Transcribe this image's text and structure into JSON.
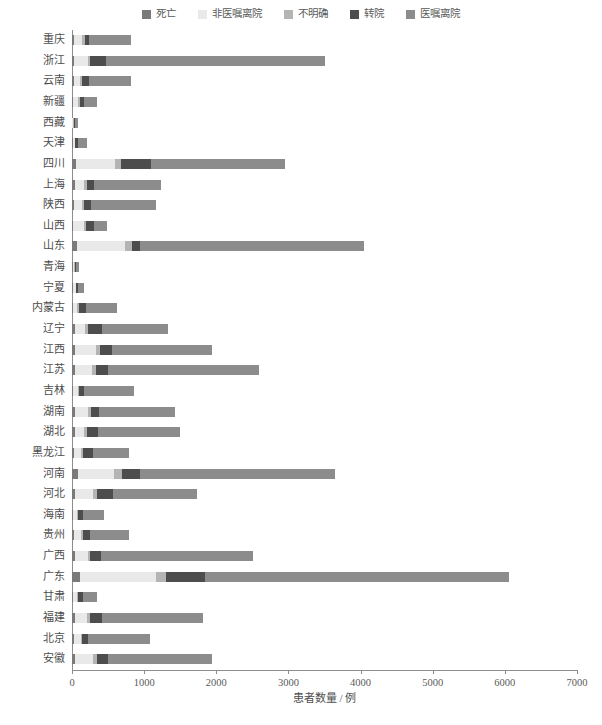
{
  "chart_data": {
    "type": "bar",
    "orientation": "horizontal",
    "stacked": true,
    "title": "",
    "subtitle": "",
    "xlabel": "患者数量 / 例",
    "ylabel": "",
    "xlim": [
      0,
      7000
    ],
    "xticks": [
      0,
      1000,
      2000,
      3000,
      4000,
      5000,
      6000,
      7000
    ],
    "xticklabels": [
      "0",
      "1000",
      "2000",
      "3000",
      "4000",
      "5000",
      "6000",
      "7000"
    ],
    "grid": false,
    "legend_position": "top-center",
    "legend": [
      "死亡",
      "非医嘱离院",
      "不明确",
      "转院",
      "医嘱离院"
    ],
    "colors": [
      "#7a7a7a",
      "#e9e9e9",
      "#b4b4b4",
      "#4d4d4d",
      "#8c8c8c"
    ],
    "categories": [
      "重庆",
      "浙江",
      "云南",
      "新疆",
      "西藏",
      "天津",
      "四川",
      "上海",
      "陕西",
      "山西",
      "山东",
      "青海",
      "宁夏",
      "内蒙古",
      "辽宁",
      "江西",
      "江苏",
      "吉林",
      "湖南",
      "湖北",
      "黑龙江",
      "河南",
      "河北",
      "海南",
      "贵州",
      "广西",
      "广东",
      "甘肃",
      "福建",
      "北京",
      "安徽"
    ],
    "series": [
      {
        "name": "死亡",
        "color": "#7a7a7a",
        "values": [
          25,
          30,
          25,
          20,
          5,
          10,
          60,
          40,
          30,
          20,
          70,
          10,
          10,
          20,
          35,
          35,
          45,
          20,
          35,
          35,
          25,
          90,
          45,
          15,
          25,
          40,
          110,
          15,
          35,
          25,
          40
        ]
      },
      {
        "name": "非医嘱离院",
        "color": "#e9e9e9",
        "values": [
          115,
          190,
          85,
          70,
          15,
          25,
          540,
          130,
          105,
          140,
          660,
          20,
          40,
          55,
          150,
          300,
          235,
          60,
          190,
          135,
          95,
          490,
          250,
          55,
          95,
          175,
          1060,
          55,
          175,
          95,
          250
        ]
      },
      {
        "name": "不明确",
        "color": "#b4b4b4",
        "values": [
          35,
          30,
          30,
          25,
          5,
          10,
          80,
          40,
          30,
          30,
          100,
          10,
          10,
          20,
          35,
          55,
          50,
          20,
          40,
          35,
          30,
          110,
          55,
          20,
          30,
          40,
          130,
          20,
          40,
          25,
          55
        ]
      },
      {
        "name": "转院",
        "color": "#4d4d4d",
        "values": [
          60,
          225,
          95,
          55,
          10,
          40,
          415,
          95,
          95,
          120,
          115,
          15,
          20,
          95,
          190,
          165,
          175,
          70,
          110,
          155,
          135,
          250,
          220,
          65,
          105,
          145,
          545,
          65,
          165,
          80,
          155
        ]
      },
      {
        "name": "医嘱离院",
        "color": "#8c8c8c",
        "values": [
          585,
          3030,
          580,
          180,
          45,
          130,
          1855,
          925,
          900,
          180,
          3100,
          45,
          80,
          440,
          920,
          1380,
          2085,
          690,
          1055,
          1140,
          505,
          2710,
          1160,
          290,
          535,
          2110,
          4210,
          195,
          1400,
          855,
          1440
        ]
      }
    ],
    "totals": [
      820,
      3505,
      815,
      350,
      80,
      215,
      2950,
      1230,
      1160,
      490,
      4045,
      100,
      160,
      630,
      1330,
      1935,
      2590,
      860,
      1430,
      1500,
      790,
      3650,
      1730,
      445,
      790,
      2510,
      6055,
      350,
      1815,
      1080,
      1940
    ]
  }
}
